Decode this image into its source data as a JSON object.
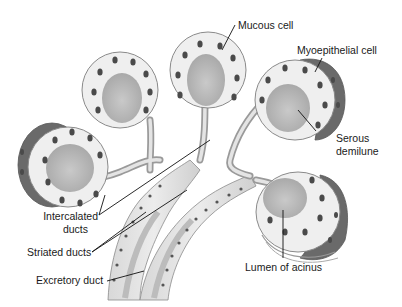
{
  "figure": {
    "colors": {
      "background": "#ffffff",
      "tissue_light": "#e9e9e9",
      "tissue_mid": "#cfcfcf",
      "lumen": "#bdbdbd",
      "nucleus": "#4a4a4a",
      "serous_demilune": "#6a6a6a",
      "leader_line": "#111111",
      "label_text": "#1a1a1a"
    }
  },
  "labels": {
    "mucous_cell": "Mucous cell",
    "myoepithelial_cell": "Myoepithelial cell",
    "serous_demilune_line1": "Serous",
    "serous_demilune_line2": "demilune",
    "intercalated_line1": "Intercalated",
    "intercalated_line2": "ducts",
    "striated_ducts": "Striated ducts",
    "excretory_duct": "Excretory duct",
    "lumen_of_acinus": "Lumen of acinus"
  }
}
